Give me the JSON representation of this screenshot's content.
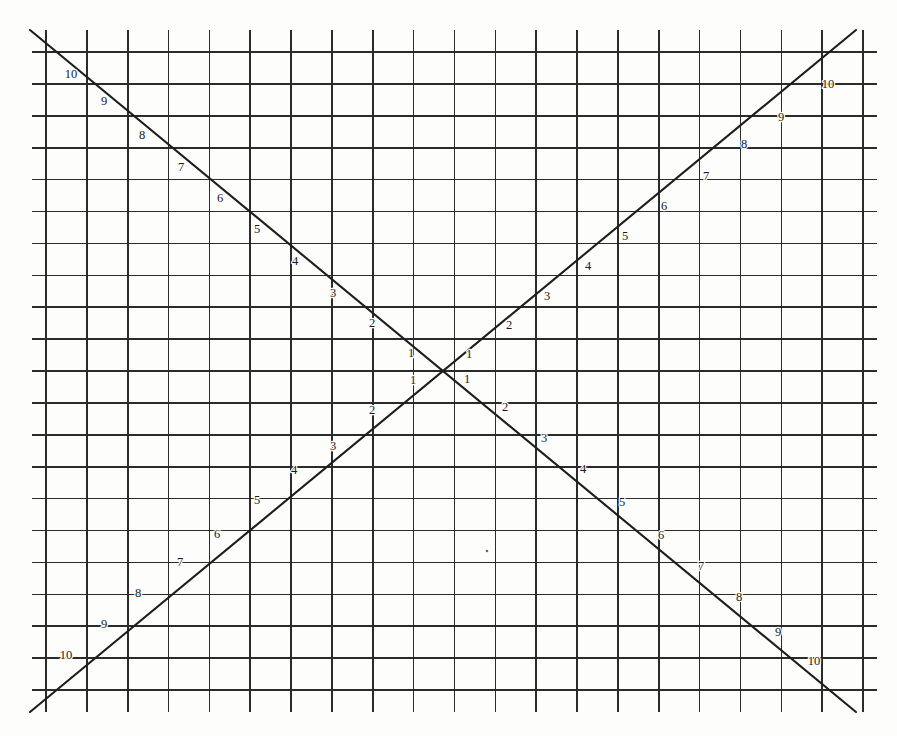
{
  "figure": {
    "type": "diagram",
    "background_color": "#fdfdfc",
    "line_color": "#2b2b2b",
    "diagonal_color": "#1d1d1d",
    "label_color": "#1a1a1a"
  },
  "grid": {
    "columns": 20,
    "rows": 20,
    "vertical_line_count": 21,
    "horizontal_line_count": 21,
    "x_start": 46,
    "x_end": 863,
    "y_start": 52,
    "y_end": 690,
    "cell_width": 40.85,
    "cell_height": 31.9
  },
  "center": {
    "x": 443,
    "y": 371,
    "label": "crossing-point"
  },
  "diagonals": [
    {
      "name": "descending",
      "description": "from upper-left to lower-right",
      "x1": 30,
      "y1": 30,
      "x2": 856,
      "y2": 712
    },
    {
      "name": "ascending",
      "description": "from lower-left to upper-right",
      "x1": 30,
      "y1": 712,
      "x2": 856,
      "y2": 30
    }
  ],
  "labels": {
    "descending_upper": [
      "10",
      "9",
      "8",
      "7",
      "6",
      "5",
      "4",
      "3",
      "2",
      "1"
    ],
    "descending_lower": [
      "1",
      "2",
      "3",
      "4",
      "5",
      "6",
      "7",
      "8",
      "9",
      "10"
    ],
    "ascending_lower": [
      "10",
      "9",
      "8",
      "7",
      "6",
      "5",
      "4",
      "3",
      "2",
      "1"
    ],
    "ascending_upper": [
      "1",
      "2",
      "3",
      "4",
      "5",
      "6",
      "7",
      "8",
      "9",
      "10"
    ]
  },
  "label_positions": {
    "descending_upper": [
      {
        "text": "10",
        "x": 71,
        "y": 78
      },
      {
        "text": "9",
        "x": 104,
        "y": 105
      },
      {
        "text": "8",
        "x": 142,
        "y": 139
      },
      {
        "text": "7",
        "x": 181,
        "y": 171
      },
      {
        "text": "6",
        "x": 220,
        "y": 202
      },
      {
        "text": "5",
        "x": 257,
        "y": 233
      },
      {
        "text": "4",
        "x": 295,
        "y": 265
      },
      {
        "text": "3",
        "x": 333,
        "y": 297
      },
      {
        "text": "2",
        "x": 372,
        "y": 327
      },
      {
        "text": "1",
        "x": 411,
        "y": 357
      }
    ],
    "descending_lower": [
      {
        "text": "1",
        "x": 467,
        "y": 383
      },
      {
        "text": "2",
        "x": 505,
        "y": 411
      },
      {
        "text": "3",
        "x": 544,
        "y": 442
      },
      {
        "text": "4",
        "x": 583,
        "y": 473
      },
      {
        "text": "5",
        "x": 622,
        "y": 506
      },
      {
        "text": "6",
        "x": 661,
        "y": 539
      },
      {
        "text": "7",
        "x": 701,
        "y": 570
      },
      {
        "text": "8",
        "x": 739,
        "y": 601
      },
      {
        "text": "9",
        "x": 778,
        "y": 636
      },
      {
        "text": "10",
        "x": 814,
        "y": 665
      }
    ],
    "ascending_lower": [
      {
        "text": "10",
        "x": 66,
        "y": 659
      },
      {
        "text": "9",
        "x": 104,
        "y": 628
      },
      {
        "text": "8",
        "x": 138,
        "y": 597
      },
      {
        "text": "7",
        "x": 180,
        "y": 566
      },
      {
        "text": "6",
        "x": 217,
        "y": 538
      },
      {
        "text": "5",
        "x": 257,
        "y": 504
      },
      {
        "text": "4",
        "x": 294,
        "y": 474
      },
      {
        "text": "3",
        "x": 333,
        "y": 450
      },
      {
        "text": "2",
        "x": 372,
        "y": 414
      },
      {
        "text": "1",
        "x": 413,
        "y": 384
      }
    ],
    "ascending_upper": [
      {
        "text": "1",
        "x": 469,
        "y": 358
      },
      {
        "text": "2",
        "x": 509,
        "y": 329
      },
      {
        "text": "3",
        "x": 547,
        "y": 300
      },
      {
        "text": "4",
        "x": 588,
        "y": 270
      },
      {
        "text": "5",
        "x": 625,
        "y": 240
      },
      {
        "text": "6",
        "x": 664,
        "y": 210
      },
      {
        "text": "7",
        "x": 706,
        "y": 180
      },
      {
        "text": "8",
        "x": 744,
        "y": 148
      },
      {
        "text": "9",
        "x": 781,
        "y": 121
      },
      {
        "text": "10",
        "x": 828,
        "y": 88
      }
    ]
  },
  "artifacts": [
    {
      "name": "paper-speck",
      "x": 487,
      "y": 551,
      "r": 1.3
    }
  ]
}
